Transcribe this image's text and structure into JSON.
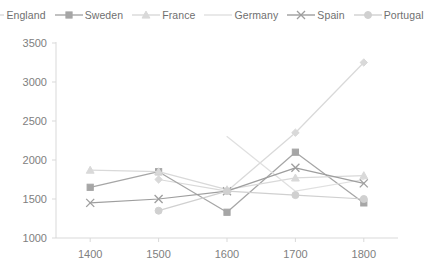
{
  "chart_data": {
    "type": "line",
    "title": "",
    "subtitle": "",
    "xlabel": "",
    "ylabel": "",
    "x": [
      1400,
      1500,
      1600,
      1700,
      1800
    ],
    "categories": [
      "1400",
      "1500",
      "1600",
      "1700",
      "1800"
    ],
    "xtick_labels": [
      "1400",
      "1500",
      "1600",
      "1700",
      "1800"
    ],
    "ytick_labels": [
      "1000",
      "1500",
      "2000",
      "2500",
      "3000",
      "3500"
    ],
    "yticks": [
      1000,
      1500,
      2000,
      2500,
      3000,
      3500
    ],
    "ylim": [
      1000,
      3500
    ],
    "xlim": [
      1350,
      1850
    ],
    "grid": false,
    "legend_position": "top",
    "series": [
      {
        "name": "England",
        "marker": "diamond",
        "color": "#d9d9d9",
        "x": [
          1500,
          1600,
          1700,
          1800
        ],
        "values": [
          1750,
          1600,
          2350,
          3250
        ]
      },
      {
        "name": "Sweden",
        "marker": "square",
        "color": "#a6a6a6",
        "x": [
          1400,
          1500,
          1600,
          1700,
          1800
        ],
        "values": [
          1650,
          1850,
          1330,
          2100,
          1450
        ]
      },
      {
        "name": "France",
        "marker": "triangle",
        "color": "#d9d9d9",
        "x": [
          1400,
          1500,
          1600,
          1700,
          1800
        ],
        "values": [
          1870,
          1850,
          1620,
          1770,
          1800
        ]
      },
      {
        "name": "Germany",
        "marker": "none",
        "color": "#e0e0e0",
        "x": [
          1600,
          1700,
          1800
        ],
        "values": [
          2300,
          1600,
          1750
        ]
      },
      {
        "name": "Spain",
        "marker": "x",
        "color": "#9e9e9e",
        "x": [
          1400,
          1500,
          1600,
          1700,
          1800
        ],
        "values": [
          1450,
          1500,
          1600,
          1900,
          1700
        ]
      },
      {
        "name": "Portugal",
        "marker": "circle",
        "color": "#d0d0d0",
        "x": [
          1500,
          1600,
          1700,
          1800
        ],
        "values": [
          1350,
          1600,
          1550,
          1500
        ]
      }
    ]
  },
  "legend": {
    "items": [
      {
        "label": "England"
      },
      {
        "label": "Sweden"
      },
      {
        "label": "France"
      },
      {
        "label": "Germany"
      },
      {
        "label": "Spain"
      },
      {
        "label": "Portugal"
      }
    ]
  },
  "colors": {
    "background": "#ffffff",
    "axis": "#d9d9d9",
    "tick_text": "#808080",
    "legend_text": "#6f6f6f"
  }
}
